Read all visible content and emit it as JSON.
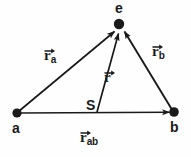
{
  "figure": {
    "background_color": "#fefefe",
    "stroke_color": "#1a1a1a",
    "points": [
      {
        "id": "a",
        "label": "a",
        "x": 17,
        "y": 113
      },
      {
        "id": "b",
        "label": "b",
        "x": 174,
        "y": 112
      },
      {
        "id": "e",
        "label": "e",
        "x": 119,
        "y": 24
      },
      {
        "id": "S",
        "label": "S",
        "x": 97,
        "y": 113
      }
    ],
    "point_labels": [
      {
        "id": "a",
        "text": "a",
        "x": 12,
        "y": 121
      },
      {
        "id": "b",
        "text": "b",
        "x": 170,
        "y": 120
      },
      {
        "id": "e",
        "text": "e",
        "x": 115,
        "y": 1
      },
      {
        "id": "S",
        "text": "S",
        "x": 86,
        "y": 98
      }
    ],
    "vectors": [
      {
        "id": "r_a",
        "base": "r",
        "subscript": "a",
        "from": "a",
        "to": "e",
        "label_x": 44,
        "label_y": 48
      },
      {
        "id": "r_b",
        "base": "r",
        "subscript": "b",
        "from": "b",
        "to": "e",
        "label_x": 152,
        "label_y": 44
      },
      {
        "id": "r",
        "base": "r",
        "subscript": "",
        "from": "S",
        "to": "e",
        "label_x": 104,
        "label_y": 70
      },
      {
        "id": "r_ab",
        "base": "r",
        "subscript": "ab",
        "from": "a",
        "to": "b",
        "label_x": 80,
        "label_y": 130
      }
    ]
  }
}
